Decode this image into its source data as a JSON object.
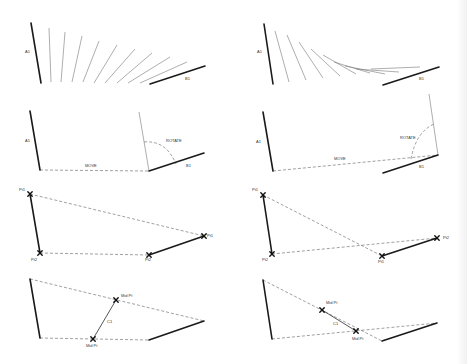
{
  "figure": {
    "panels": [
      {
        "id": "sweep-linear",
        "labels": [
          {
            "text": "A1",
            "x": 25,
            "y": 53
          },
          {
            "text": "B1",
            "x": 185,
            "y": 80
          }
        ],
        "lines_thick": [
          [
            31,
            23,
            41,
            83
          ],
          [
            150,
            84,
            205,
            66
          ]
        ],
        "lines_thin": [
          [
            49,
            28,
            51,
            82
          ],
          [
            65,
            32,
            61,
            82
          ],
          [
            82,
            36,
            72,
            82
          ],
          [
            99,
            41,
            83,
            82
          ],
          [
            117,
            45,
            94,
            83
          ],
          [
            135,
            49,
            105,
            83
          ],
          [
            152,
            53,
            117,
            83
          ],
          [
            170,
            57,
            128,
            83
          ],
          [
            187,
            62,
            140,
            83
          ]
        ],
        "dashes": []
      },
      {
        "id": "sweep-curved",
        "labels": [
          {
            "text": "A1",
            "x": 257,
            "y": 53
          },
          {
            "text": "B1",
            "x": 419,
            "y": 80
          }
        ],
        "lines_thick": [
          [
            264,
            24,
            273,
            84
          ],
          [
            383,
            85,
            439,
            67
          ]
        ],
        "lines_thin": [
          [
            275,
            31,
            289,
            82
          ],
          [
            287,
            35,
            306,
            80
          ],
          [
            299,
            42,
            323,
            78
          ],
          [
            311,
            49,
            340,
            76
          ],
          [
            323,
            55,
            356,
            74
          ],
          [
            334,
            62,
            370,
            73
          ],
          [
            345,
            66,
            385,
            74
          ],
          [
            356,
            69,
            399,
            72
          ],
          [
            371,
            69,
            420,
            67
          ]
        ],
        "dashes": []
      },
      {
        "id": "move-rotate-1",
        "labels": [
          {
            "text": "A1",
            "x": 25,
            "y": 142
          },
          {
            "text": "MOVE",
            "x": 85,
            "y": 167
          },
          {
            "text": "ROTATE",
            "x": 166,
            "y": 142
          },
          {
            "text": "B1",
            "x": 186,
            "y": 167
          }
        ],
        "lines_thick": [
          [
            30,
            111,
            40,
            170
          ],
          [
            149,
            171,
            204,
            153
          ]
        ],
        "lines_thin": [
          [
            139,
            112,
            149,
            171
          ]
        ],
        "dashes": [
          {
            "d": "M40 170 L149 171"
          },
          {
            "d": "M144 142 Q166 140 176 164"
          }
        ]
      },
      {
        "id": "move-rotate-2",
        "labels": [
          {
            "text": "A1",
            "x": 256,
            "y": 143
          },
          {
            "text": "MOVE",
            "x": 334,
            "y": 160
          },
          {
            "text": "ROTATE",
            "x": 400,
            "y": 139
          },
          {
            "text": "B1",
            "x": 419,
            "y": 168
          }
        ],
        "lines_thick": [
          [
            263,
            112,
            273,
            171
          ],
          [
            383,
            173,
            438,
            155
          ]
        ],
        "lines_thin": [
          [
            429,
            94,
            438,
            155
          ]
        ],
        "dashes": [
          {
            "d": "M273 171 L438 155"
          },
          {
            "d": "M411 159 Q416 132 434 124"
          }
        ]
      },
      {
        "id": "points-1",
        "labels": [
          {
            "text": "Pt1",
            "x": 19,
            "y": 191
          },
          {
            "text": "Pt2",
            "x": 31,
            "y": 261
          },
          {
            "text": "Pt2",
            "x": 145,
            "y": 261
          },
          {
            "text": "Pt1",
            "x": 207,
            "y": 237
          }
        ],
        "lines_thick": [
          [
            30,
            194,
            40,
            253
          ],
          [
            149,
            255,
            204,
            236
          ]
        ],
        "lines_thin": [],
        "dashes": [
          {
            "d": "M30 194 L204 236"
          },
          {
            "d": "M40 253 L149 255"
          }
        ],
        "crosses": [
          [
            30,
            194
          ],
          [
            40,
            253
          ],
          [
            149,
            255
          ],
          [
            204,
            236
          ]
        ]
      },
      {
        "id": "points-2",
        "labels": [
          {
            "text": "Pt1",
            "x": 252,
            "y": 191
          },
          {
            "text": "Pt2",
            "x": 262,
            "y": 261
          },
          {
            "text": "Pt1",
            "x": 378,
            "y": 263
          },
          {
            "text": "Pt2",
            "x": 443,
            "y": 239
          }
        ],
        "lines_thick": [
          [
            263,
            195,
            272,
            254
          ],
          [
            382,
            256,
            437,
            238
          ]
        ],
        "lines_thin": [],
        "dashes": [
          {
            "d": "M263 195 L382 256"
          },
          {
            "d": "M272 254 L437 238"
          }
        ],
        "crosses": [
          [
            263,
            195
          ],
          [
            272,
            254
          ],
          [
            382,
            256
          ],
          [
            437,
            238
          ]
        ]
      },
      {
        "id": "midpoints-1",
        "labels": [
          {
            "text": "Mid Pt",
            "x": 121,
            "y": 297
          },
          {
            "text": "C1",
            "x": 107,
            "y": 323
          },
          {
            "text": "Mid Pt",
            "x": 86,
            "y": 347
          }
        ],
        "lines_thick": [
          [
            30,
            279,
            40,
            338
          ],
          [
            149,
            340,
            204,
            321
          ]
        ],
        "lines_thin": [],
        "dashes": [
          {
            "d": "M30 279 L204 321"
          },
          {
            "d": "M40 338 L149 340"
          }
        ],
        "links": [
          [
            93,
            339,
            116,
            300
          ]
        ],
        "crosses": [
          [
            116,
            300
          ],
          [
            93,
            339
          ]
        ]
      },
      {
        "id": "midpoints-2",
        "labels": [
          {
            "text": "Mid Pt",
            "x": 326,
            "y": 304
          },
          {
            "text": "C1",
            "x": 333,
            "y": 325
          },
          {
            "text": "Mid Pt",
            "x": 352,
            "y": 340
          }
        ],
        "lines_thick": [
          [
            263,
            280,
            272,
            339
          ],
          [
            382,
            341,
            437,
            323
          ]
        ],
        "lines_thin": [],
        "dashes": [
          {
            "d": "M263 280 L382 341"
          },
          {
            "d": "M272 339 L437 323"
          }
        ],
        "links": [
          [
            322,
            310,
            356,
            331
          ]
        ],
        "crosses": [
          [
            322,
            310
          ],
          [
            356,
            331
          ]
        ]
      }
    ]
  },
  "colors": {
    "thick_line": "#1a1a1a",
    "thin_line": "#777777",
    "dashed_line": "#777777",
    "background": "#ffffff"
  }
}
